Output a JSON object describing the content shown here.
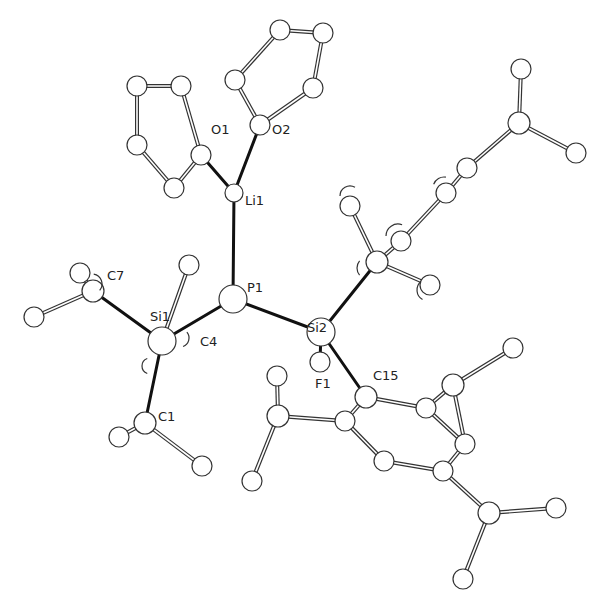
{
  "figure": {
    "type": "ORTEP-style molecular structure drawing",
    "labels": [
      {
        "id": "O1",
        "text": "O1",
        "x": 211,
        "y": 134
      },
      {
        "id": "O2",
        "text": "O2",
        "x": 272,
        "y": 134
      },
      {
        "id": "Li1",
        "text": "Li1",
        "x": 245,
        "y": 205
      },
      {
        "id": "P1",
        "text": "P1",
        "x": 247,
        "y": 292
      },
      {
        "id": "Si1",
        "text": "Si1",
        "x": 150,
        "y": 321
      },
      {
        "id": "C4",
        "text": "C4",
        "x": 200,
        "y": 346
      },
      {
        "id": "C7",
        "text": "C7",
        "x": 107,
        "y": 280
      },
      {
        "id": "C1",
        "text": "C1",
        "x": 158,
        "y": 421
      },
      {
        "id": "Si2",
        "text": "Si2",
        "x": 307,
        "y": 332
      },
      {
        "id": "F1",
        "text": "F1",
        "x": 315,
        "y": 388
      },
      {
        "id": "C15",
        "text": "C15",
        "x": 373,
        "y": 380
      }
    ],
    "atoms": [
      {
        "id": "thf1_a",
        "x": 137,
        "y": 86,
        "r": 10
      },
      {
        "id": "thf1_b",
        "x": 181,
        "y": 86,
        "r": 10
      },
      {
        "id": "thf1_c",
        "x": 137,
        "y": 145,
        "r": 10
      },
      {
        "id": "thf1_d",
        "x": 174,
        "y": 188,
        "r": 10
      },
      {
        "id": "O1",
        "x": 201,
        "y": 155,
        "r": 10
      },
      {
        "id": "thf2_a",
        "x": 280,
        "y": 30,
        "r": 10
      },
      {
        "id": "thf2_b",
        "x": 323,
        "y": 33,
        "r": 10
      },
      {
        "id": "thf2_c",
        "x": 235,
        "y": 80,
        "r": 10
      },
      {
        "id": "thf2_d",
        "x": 313,
        "y": 88,
        "r": 10
      },
      {
        "id": "O2",
        "x": 260,
        "y": 125,
        "r": 10
      },
      {
        "id": "Li1",
        "x": 234,
        "y": 193,
        "r": 9
      },
      {
        "id": "P1",
        "x": 233,
        "y": 299,
        "r": 14
      },
      {
        "id": "Si1",
        "x": 162,
        "y": 341,
        "r": 14
      },
      {
        "id": "C4_top",
        "x": 189,
        "y": 265,
        "r": 10
      },
      {
        "id": "C7",
        "x": 93,
        "y": 291,
        "r": 11
      },
      {
        "id": "C7_a",
        "x": 80,
        "y": 273,
        "r": 10
      },
      {
        "id": "C7_b",
        "x": 34,
        "y": 317,
        "r": 10
      },
      {
        "id": "C1",
        "x": 145,
        "y": 423,
        "r": 11
      },
      {
        "id": "C1_a",
        "x": 119,
        "y": 437,
        "r": 10
      },
      {
        "id": "C1_b",
        "x": 202,
        "y": 466,
        "r": 10
      },
      {
        "id": "Si2",
        "x": 321,
        "y": 332,
        "r": 14
      },
      {
        "id": "F1",
        "x": 320,
        "y": 362,
        "r": 10
      },
      {
        "id": "Cup",
        "x": 377,
        "y": 262,
        "r": 11
      },
      {
        "id": "Cup_a",
        "x": 350,
        "y": 206,
        "r": 10
      },
      {
        "id": "Cup_b",
        "x": 430,
        "y": 285,
        "r": 10
      },
      {
        "id": "Ar2_a",
        "x": 401,
        "y": 241,
        "r": 10
      },
      {
        "id": "Ar2_b",
        "x": 446,
        "y": 193,
        "r": 10
      },
      {
        "id": "Ar2_c",
        "x": 467,
        "y": 168,
        "r": 10
      },
      {
        "id": "Ar2_d",
        "x": 519,
        "y": 123,
        "r": 11
      },
      {
        "id": "Ar2_e",
        "x": 521,
        "y": 69,
        "r": 10
      },
      {
        "id": "Ar2_f",
        "x": 576,
        "y": 153,
        "r": 10
      },
      {
        "id": "C15",
        "x": 366,
        "y": 397,
        "r": 11
      },
      {
        "id": "ar_c1",
        "x": 345,
        "y": 421,
        "r": 10
      },
      {
        "id": "ar_c2",
        "x": 384,
        "y": 461,
        "r": 10
      },
      {
        "id": "ar_c3",
        "x": 443,
        "y": 471,
        "r": 10
      },
      {
        "id": "ar_c4",
        "x": 465,
        "y": 444,
        "r": 10
      },
      {
        "id": "ar_c5",
        "x": 426,
        "y": 408,
        "r": 10
      },
      {
        "id": "iPrA_c",
        "x": 278,
        "y": 416,
        "r": 11
      },
      {
        "id": "iPrA_a",
        "x": 277,
        "y": 376,
        "r": 10
      },
      {
        "id": "iPrA_b",
        "x": 252,
        "y": 481,
        "r": 10
      },
      {
        "id": "iPrB_c",
        "x": 453,
        "y": 385,
        "r": 11
      },
      {
        "id": "iPrB_a",
        "x": 513,
        "y": 348,
        "r": 10
      },
      {
        "id": "iPrC_c",
        "x": 489,
        "y": 513,
        "r": 11
      },
      {
        "id": "iPrC_a",
        "x": 556,
        "y": 508,
        "r": 10
      },
      {
        "id": "iPrC_b",
        "x": 463,
        "y": 579,
        "r": 10
      }
    ],
    "bonds_solid": [
      [
        "O1",
        "Li1"
      ],
      [
        "O2",
        "Li1"
      ],
      [
        "Li1",
        "P1"
      ],
      [
        "P1",
        "Si1"
      ],
      [
        "P1",
        "Si2"
      ],
      [
        "Si1",
        "C7"
      ],
      [
        "Si1",
        "C1"
      ],
      [
        "Si2",
        "Cup"
      ],
      [
        "Si2",
        "C15"
      ],
      [
        "Si2",
        "F1"
      ]
    ],
    "bonds_open": [
      [
        "thf1_a",
        "thf1_b"
      ],
      [
        "thf1_a",
        "thf1_c"
      ],
      [
        "thf1_c",
        "thf1_d"
      ],
      [
        "thf1_d",
        "O1"
      ],
      [
        "O1",
        "thf1_b"
      ],
      [
        "thf2_a",
        "thf2_b"
      ],
      [
        "thf2_a",
        "thf2_c"
      ],
      [
        "thf2_b",
        "thf2_d"
      ],
      [
        "thf2_d",
        "O2"
      ],
      [
        "O2",
        "thf2_c"
      ],
      [
        "Si1",
        "C4_top"
      ],
      [
        "C7",
        "C7_a"
      ],
      [
        "C7",
        "C7_b"
      ],
      [
        "C1",
        "C1_a"
      ],
      [
        "C1",
        "C1_b"
      ],
      [
        "Cup",
        "Cup_a"
      ],
      [
        "Cup",
        "Cup_b"
      ],
      [
        "Cup",
        "Ar2_a"
      ],
      [
        "Ar2_a",
        "Ar2_b"
      ],
      [
        "Ar2_b",
        "Ar2_c"
      ],
      [
        "Ar2_c",
        "Ar2_d"
      ],
      [
        "Ar2_d",
        "Ar2_e"
      ],
      [
        "Ar2_d",
        "Ar2_f"
      ],
      [
        "C15",
        "ar_c1"
      ],
      [
        "ar_c1",
        "ar_c2"
      ],
      [
        "ar_c2",
        "ar_c3"
      ],
      [
        "ar_c3",
        "ar_c4"
      ],
      [
        "ar_c4",
        "ar_c5"
      ],
      [
        "ar_c5",
        "C15"
      ],
      [
        "ar_c1",
        "iPrA_c"
      ],
      [
        "iPrA_c",
        "iPrA_a"
      ],
      [
        "iPrA_c",
        "iPrA_b"
      ],
      [
        "ar_c5",
        "iPrB_c"
      ],
      [
        "iPrB_c",
        "iPrB_a"
      ],
      [
        "iPrB_c",
        "ar_c4"
      ],
      [
        "ar_c3",
        "iPrC_c"
      ],
      [
        "iPrC_c",
        "iPrC_a"
      ],
      [
        "iPrC_c",
        "iPrC_b"
      ]
    ],
    "hidden_arcs": [
      {
        "x": 350,
        "y": 196,
        "r": 10,
        "start": 180,
        "end": 300
      },
      {
        "x": 398,
        "y": 236,
        "r": 12,
        "start": 180,
        "end": 290
      },
      {
        "x": 368,
        "y": 268,
        "r": 11,
        "start": 140,
        "end": 220
      },
      {
        "x": 428,
        "y": 290,
        "r": 11,
        "start": 120,
        "end": 230
      },
      {
        "x": 444,
        "y": 188,
        "r": 11,
        "start": 200,
        "end": 280
      },
      {
        "x": 180,
        "y": 338,
        "r": 9,
        "start": -40,
        "end": 70
      },
      {
        "x": 150,
        "y": 366,
        "r": 8,
        "start": 110,
        "end": 250
      },
      {
        "x": 92,
        "y": 284,
        "r": 10,
        "start": -80,
        "end": 40
      }
    ]
  }
}
